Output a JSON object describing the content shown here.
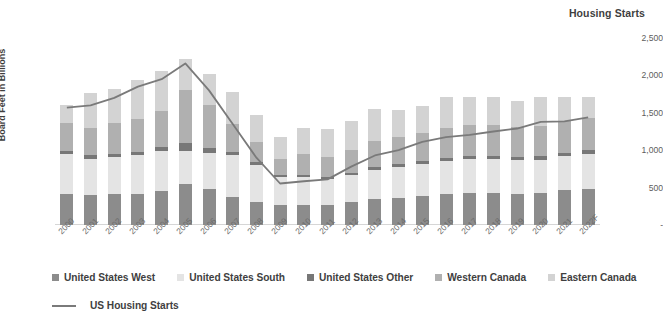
{
  "chart_data": {
    "type": "bar",
    "subtype": "stacked-bar-with-line-overlay",
    "title": "",
    "xlabel": "",
    "ylabel": "Board Feet in Billions",
    "y2label": "Housing Starts",
    "ylim": [
      0,
      90
    ],
    "y2lim": [
      0,
      2500
    ],
    "yticks": [
      "0.0",
      "10.0",
      "20.0",
      "30.0",
      "40.0",
      "50.0",
      "60.0",
      "70.0",
      "80.0",
      "90.0"
    ],
    "y2ticks": [
      "-",
      "500",
      "1,000",
      "1,500",
      "2,000",
      "2,500"
    ],
    "grid": false,
    "legend_position": "bottom-left",
    "categories": [
      "2000",
      "2001",
      "2002",
      "2003",
      "2004",
      "2005",
      "2006",
      "2007",
      "2008",
      "2009",
      "2010",
      "2011",
      "2012",
      "2013",
      "2014",
      "2015",
      "2016",
      "2017",
      "2018",
      "2019",
      "2020",
      "2021",
      "2022F"
    ],
    "series": [
      {
        "name": "United States West",
        "axis": "left",
        "color": "#8c8c8c",
        "values": [
          15.0,
          14.5,
          14.8,
          15.0,
          16.2,
          19.5,
          17.5,
          13.5,
          11.0,
          9.5,
          9.8,
          9.8,
          11.0,
          12.5,
          13.2,
          14.0,
          14.8,
          15.2,
          15.2,
          15.0,
          15.5,
          17.0,
          17.5
        ]
      },
      {
        "name": "United States South",
        "axis": "left",
        "color": "#e4e4e4",
        "values": [
          19.0,
          17.5,
          18.0,
          18.5,
          19.5,
          16.0,
          17.0,
          20.0,
          18.0,
          13.5,
          13.5,
          12.5,
          13.0,
          14.0,
          14.8,
          15.5,
          16.0,
          16.5,
          16.5,
          16.2,
          16.0,
          16.0,
          16.5
        ]
      },
      {
        "name": "United States Other",
        "axis": "left",
        "color": "#777777",
        "values": [
          1.8,
          1.6,
          1.6,
          1.7,
          2.0,
          3.8,
          2.5,
          1.5,
          1.2,
          1.0,
          1.0,
          1.0,
          1.2,
          1.3,
          1.5,
          1.5,
          1.6,
          1.6,
          1.6,
          1.6,
          1.6,
          1.8,
          2.0
        ]
      },
      {
        "name": "Western Canada",
        "axis": "left",
        "color": "#b0b0b0",
        "values": [
          13.5,
          13.0,
          14.5,
          16.0,
          17.0,
          25.5,
          21.0,
          13.5,
          10.0,
          8.0,
          10.0,
          9.5,
          11.0,
          12.5,
          13.0,
          13.5,
          14.5,
          15.0,
          15.0,
          14.5,
          14.8,
          15.5,
          15.5
        ]
      },
      {
        "name": "Eastern Canada",
        "axis": "left",
        "color": "#d3d3d3",
        "values": [
          8.5,
          17.0,
          16.5,
          18.5,
          19.5,
          15.0,
          14.5,
          15.5,
          13.0,
          10.5,
          12.5,
          13.5,
          14.0,
          15.5,
          13.0,
          13.0,
          14.5,
          13.5,
          13.5,
          12.5,
          13.5,
          11.5,
          10.0
        ]
      }
    ],
    "line_series": {
      "name": "US Housing Starts",
      "axis": "right",
      "color": "#7a7a7a",
      "values": [
        1570,
        1600,
        1700,
        1850,
        1950,
        2160,
        1800,
        1350,
        900,
        555,
        585,
        610,
        780,
        930,
        1000,
        1110,
        1175,
        1205,
        1250,
        1290,
        1380,
        1385,
        1440
      ]
    },
    "totals": [
      57.8,
      63.6,
      65.4,
      69.7,
      74.2,
      79.8,
      72.5,
      64.0,
      53.2,
      42.5,
      46.8,
      46.3,
      50.2,
      55.8,
      55.5,
      57.5,
      61.4,
      61.8,
      61.8,
      59.8,
      61.4,
      61.8,
      61.5
    ]
  },
  "axes": {
    "left_title": "Board Feet in Billions",
    "right_title": "Housing Starts"
  },
  "legend": {
    "items": [
      {
        "label": "United States West",
        "color": "#8c8c8c"
      },
      {
        "label": "United States South",
        "color": "#e4e4e4"
      },
      {
        "label": "United States Other",
        "color": "#777777"
      },
      {
        "label": "Western Canada",
        "color": "#b0b0b0"
      },
      {
        "label": "Eastern Canada",
        "color": "#d3d3d3"
      }
    ],
    "line_item": {
      "label": "US Housing Starts",
      "color": "#7a7a7a"
    }
  }
}
